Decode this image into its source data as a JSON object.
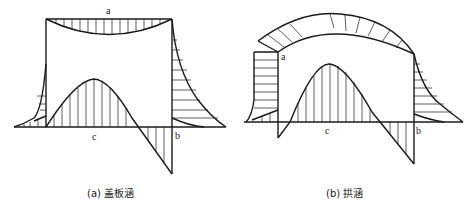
{
  "figures": [
    {
      "id": "a",
      "caption": "(a) 盖板涵",
      "points": {
        "top": "a",
        "bottom_mid": "c",
        "bottom_right": "b"
      }
    },
    {
      "id": "b",
      "caption": "(b) 拱涵",
      "points": {
        "top_left": "a",
        "bottom_mid": "c",
        "bottom_right": "b"
      }
    }
  ]
}
